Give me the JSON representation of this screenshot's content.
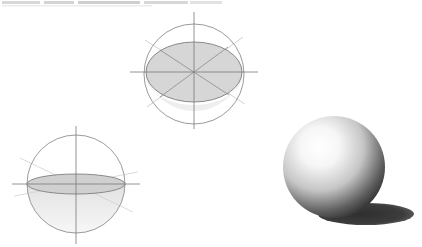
{
  "figure": {
    "background": "#ffffff",
    "caption_remnant": ""
  },
  "colors": {
    "outline": "#8a8a8a",
    "axis": "#7a7a7a",
    "guide": "#c4c4c4",
    "ellipse_fill": "#d4d4d4",
    "lower_fill": "#ececec",
    "sphere_highlight": "#ffffff",
    "sphere_mid": "#bdbdbd",
    "sphere_dark": "#2e2e2e",
    "shadow": "#3a3a3a"
  },
  "diagrams": [
    {
      "name": "tilted-sphere-construction",
      "center": [
        194,
        72
      ],
      "circle_r": 50,
      "ellipse": {
        "rx": 48,
        "ry": 30
      },
      "axis_h": [
        130,
        258
      ],
      "axis_v": [
        12,
        129
      ]
    },
    {
      "name": "horizon-sphere-construction",
      "center": [
        76,
        184
      ],
      "circle_r": 49,
      "ellipse": {
        "rx": 49,
        "ry": 10
      },
      "axis_h": [
        12,
        140
      ],
      "axis_v": [
        126,
        244
      ]
    },
    {
      "name": "shaded-sphere",
      "center": [
        334,
        167
      ],
      "r": 51,
      "shadow": {
        "cx": 366,
        "cy": 214,
        "rx": 48,
        "ry": 11
      }
    }
  ]
}
